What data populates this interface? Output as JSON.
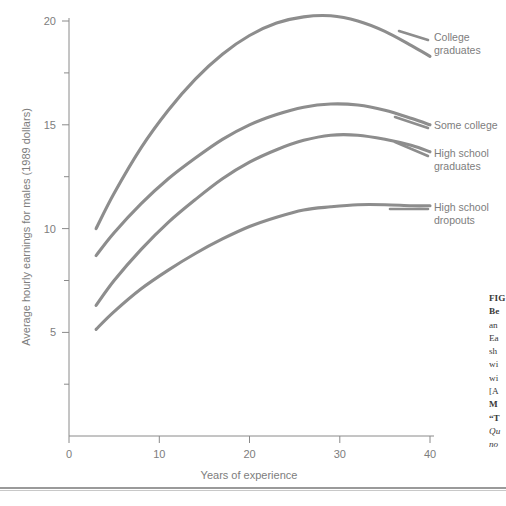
{
  "chart_data": {
    "type": "line",
    "title": "",
    "xlabel": "Years of experience",
    "ylabel": "Average hourly earnings for males (1989 dollars)",
    "xlim": [
      0,
      41
    ],
    "ylim": [
      0,
      21
    ],
    "xticks": [
      0,
      10,
      20,
      30,
      40
    ],
    "yticks": [
      5,
      10,
      15,
      20
    ],
    "yminor": [
      2.5,
      7.5,
      12.5,
      17.5
    ],
    "grid": false,
    "legend_position": "right-inline-labels",
    "series": [
      {
        "name": "College graduates",
        "label_lines": [
          "College",
          "graduates"
        ],
        "x": [
          3,
          5,
          8,
          11,
          14,
          17,
          20,
          23,
          26,
          29,
          32,
          35,
          38,
          40
        ],
        "values": [
          10.0,
          11.7,
          13.9,
          15.7,
          17.2,
          18.4,
          19.3,
          19.9,
          20.2,
          20.25,
          20.0,
          19.5,
          18.8,
          18.3
        ]
      },
      {
        "name": "Some college",
        "label_lines": [
          "Some college"
        ],
        "x": [
          3,
          5,
          8,
          11,
          14,
          17,
          20,
          23,
          26,
          29,
          32,
          35,
          38,
          40
        ],
        "values": [
          8.7,
          9.8,
          11.2,
          12.4,
          13.4,
          14.3,
          15.0,
          15.5,
          15.85,
          16.0,
          15.95,
          15.7,
          15.3,
          15.0
        ]
      },
      {
        "name": "High school graduates",
        "label_lines": [
          "High school",
          "graduates"
        ],
        "x": [
          3,
          5,
          8,
          11,
          14,
          17,
          20,
          23,
          26,
          29,
          32,
          35,
          38,
          40
        ],
        "values": [
          6.3,
          7.5,
          9.0,
          10.3,
          11.4,
          12.4,
          13.2,
          13.8,
          14.25,
          14.5,
          14.5,
          14.3,
          14.0,
          13.7
        ]
      },
      {
        "name": "High school dropouts",
        "label_lines": [
          "High school",
          "dropouts"
        ],
        "x": [
          3,
          5,
          8,
          11,
          14,
          17,
          20,
          23,
          26,
          29,
          32,
          35,
          38,
          40
        ],
        "values": [
          5.15,
          6.0,
          7.1,
          8.0,
          8.8,
          9.5,
          10.1,
          10.55,
          10.9,
          11.05,
          11.15,
          11.15,
          11.1,
          11.1
        ]
      }
    ],
    "colors": {
      "line": "#8d8d8d",
      "axis": "#8a8a8a",
      "text": "#7d7d7d"
    }
  },
  "axes": {
    "x_tick_labels": [
      "0",
      "10",
      "20",
      "30",
      "40"
    ],
    "y_tick_labels": [
      "5",
      "10",
      "15",
      "20"
    ],
    "x_title": "Years of experience",
    "y_title": "Average hourly earnings for males (1989 dollars)"
  },
  "series_labels": {
    "college_line1": "College",
    "college_line2": "graduates",
    "some_college_line1": "Some college",
    "hs_grad_line1": "High school",
    "hs_grad_line2": "graduates",
    "hs_drop_line1": "High school",
    "hs_drop_line2": "dropouts"
  },
  "caption": {
    "lines": [
      "FIG",
      "Be",
      "an",
      "Ea",
      "sh",
      "wi",
      "wi",
      "[A",
      "M",
      "“T",
      "Qu",
      "no"
    ]
  }
}
